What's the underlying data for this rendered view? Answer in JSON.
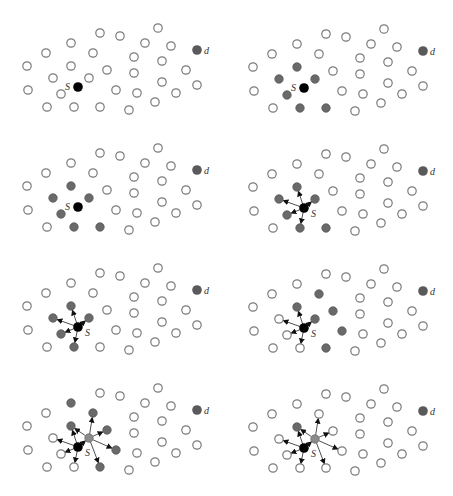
{
  "figure": {
    "layout": {
      "columns": 2,
      "rows": 4,
      "col_offset_x": 226,
      "row_offset_y": 120
    },
    "colors": {
      "empty_stroke": "#7a7a7a",
      "informed_fill": "#6a6a6a",
      "relay_fill": "#8a8a8a",
      "source_fill": "#000000",
      "dest_fill": "#5a5a5a",
      "edge": "#222222"
    },
    "labels": {
      "source": "S",
      "destination": "d"
    },
    "nodes": [
      {
        "id": "n0",
        "x": 100,
        "y": 33
      },
      {
        "id": "n1",
        "x": 71,
        "y": 43
      },
      {
        "id": "n2",
        "x": 46,
        "y": 53
      },
      {
        "id": "n3",
        "x": 93,
        "y": 53
      },
      {
        "id": "n4",
        "x": 27,
        "y": 66
      },
      {
        "id": "n5",
        "x": 71,
        "y": 66
      },
      {
        "id": "n6",
        "x": 107,
        "y": 70
      },
      {
        "id": "n7",
        "x": 53,
        "y": 78
      },
      {
        "id": "n8",
        "x": 89,
        "y": 78
      },
      {
        "id": "s",
        "x": 78,
        "y": 87
      },
      {
        "id": "n9",
        "x": 28,
        "y": 90
      },
      {
        "id": "n10",
        "x": 61,
        "y": 94
      },
      {
        "id": "n11",
        "x": 47,
        "y": 107
      },
      {
        "id": "n12",
        "x": 74,
        "y": 107
      },
      {
        "id": "n13",
        "x": 100,
        "y": 107
      },
      {
        "id": "n14",
        "x": 158,
        "y": 28
      },
      {
        "id": "n15",
        "x": 120,
        "y": 36
      },
      {
        "id": "n16",
        "x": 145,
        "y": 43
      },
      {
        "id": "n17",
        "x": 171,
        "y": 46
      },
      {
        "id": "d",
        "x": 197,
        "y": 50
      },
      {
        "id": "n18",
        "x": 134,
        "y": 57
      },
      {
        "id": "n19",
        "x": 162,
        "y": 61
      },
      {
        "id": "n20",
        "x": 186,
        "y": 70
      },
      {
        "id": "n21",
        "x": 134,
        "y": 73
      },
      {
        "id": "n22",
        "x": 162,
        "y": 82
      },
      {
        "id": "n23",
        "x": 197,
        "y": 85
      },
      {
        "id": "n24",
        "x": 116,
        "y": 90
      },
      {
        "id": "n25",
        "x": 137,
        "y": 93
      },
      {
        "id": "n26",
        "x": 176,
        "y": 93
      },
      {
        "id": "n27",
        "x": 155,
        "y": 102
      },
      {
        "id": "n28",
        "x": 129,
        "y": 110
      }
    ],
    "panels": [
      {
        "step": 1,
        "gray": [],
        "relay": null,
        "edges": []
      },
      {
        "step": 2,
        "gray": [
          "n5",
          "n7",
          "n8",
          "n10",
          "n12",
          "n13"
        ],
        "relay": null,
        "edges": []
      },
      {
        "step": 3,
        "gray": [
          "n5",
          "n7",
          "n8",
          "n10",
          "n12",
          "n13"
        ],
        "relay": null,
        "edges": []
      },
      {
        "step": 4,
        "gray": [
          "n5",
          "n7",
          "n8",
          "n10",
          "n12",
          "n13"
        ],
        "relay": null,
        "edges": [
          [
            "s",
            "n5"
          ],
          [
            "s",
            "n7"
          ],
          [
            "s",
            "n8"
          ],
          [
            "s",
            "n10"
          ],
          [
            "s",
            "n12"
          ]
        ]
      },
      {
        "step": 5,
        "gray": [
          "n5",
          "n7",
          "n8",
          "n10",
          "n12"
        ],
        "relay": null,
        "edges": [
          [
            "s",
            "n5"
          ],
          [
            "s",
            "n7"
          ],
          [
            "s",
            "n8"
          ],
          [
            "s",
            "n10"
          ],
          [
            "s",
            "n12"
          ]
        ]
      },
      {
        "step": 6,
        "gray": [
          "n5",
          "n8",
          "n3",
          "n6",
          "n24",
          "n13"
        ],
        "relay": null,
        "edges": [
          [
            "s",
            "n5"
          ],
          [
            "s",
            "n7"
          ],
          [
            "s",
            "n8"
          ],
          [
            "s",
            "n10"
          ],
          [
            "s",
            "n12"
          ]
        ]
      },
      {
        "step": 7,
        "gray": [
          "n1",
          "n3",
          "n6",
          "n24",
          "n13",
          "n5"
        ],
        "relay": "n8",
        "edges": [
          [
            "s",
            "n5"
          ],
          [
            "s",
            "n7"
          ],
          [
            "s",
            "n8"
          ],
          [
            "s",
            "n10"
          ],
          [
            "s",
            "n12"
          ],
          [
            "n8",
            "n3"
          ],
          [
            "n8",
            "n6"
          ],
          [
            "n8",
            "n24"
          ],
          [
            "n8",
            "n13"
          ],
          [
            "n8",
            "n5"
          ]
        ]
      },
      {
        "step": 8,
        "gray": [
          "n5"
        ],
        "relay": "n8",
        "edges": [
          [
            "s",
            "n5"
          ],
          [
            "s",
            "n7"
          ],
          [
            "s",
            "n8"
          ],
          [
            "s",
            "n10"
          ],
          [
            "s",
            "n12"
          ],
          [
            "n8",
            "n3"
          ],
          [
            "n8",
            "n6"
          ],
          [
            "n8",
            "n24"
          ],
          [
            "n8",
            "n13"
          ],
          [
            "n8",
            "n5"
          ]
        ]
      }
    ]
  }
}
